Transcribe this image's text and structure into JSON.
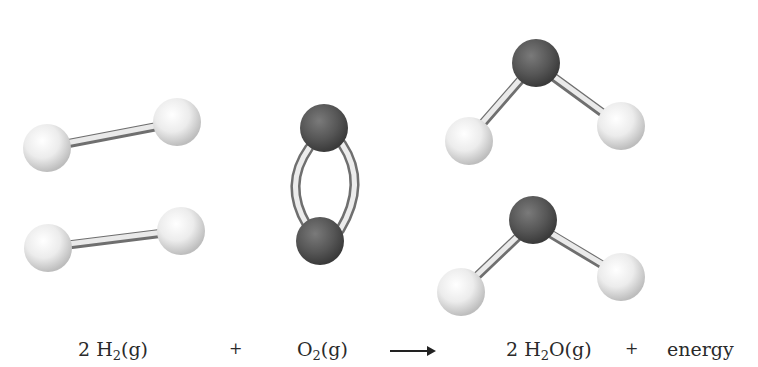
{
  "diagram": {
    "colors": {
      "hydrogen_atom": "#e8e8e8",
      "oxygen_atom": "#555555",
      "bond": "#dcdcdc",
      "text": "#2a2a2a"
    },
    "molecules": [
      {
        "id": "h2-1",
        "formula": "H2",
        "atoms": [
          "H",
          "H"
        ]
      },
      {
        "id": "h2-2",
        "formula": "H2",
        "atoms": [
          "H",
          "H"
        ]
      },
      {
        "id": "o2",
        "formula": "O2",
        "atoms": [
          "O",
          "O"
        ],
        "bond": "double"
      },
      {
        "id": "h2o-1",
        "formula": "H2O",
        "atoms": [
          "O",
          "H",
          "H"
        ]
      },
      {
        "id": "h2o-2",
        "formula": "H2O",
        "atoms": [
          "O",
          "H",
          "H"
        ]
      }
    ],
    "equation": {
      "reactant1": {
        "coef": "2",
        "symbol": "H",
        "sub": "2",
        "state": "(g)"
      },
      "plus1": "+",
      "reactant2": {
        "symbol": "O",
        "sub": "2",
        "state": "(g)"
      },
      "arrow": "→",
      "product1": {
        "coef": "2",
        "symbol": "H",
        "sub": "2",
        "rest": "O",
        "state": "(g)"
      },
      "plus2": "+",
      "product2": "energy"
    }
  }
}
